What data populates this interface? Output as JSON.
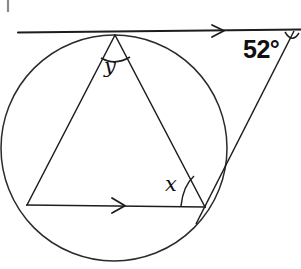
{
  "figure": {
    "type": "circle-geometry-diagram",
    "background_color": "#ffffff",
    "stroke_color": "#1d1d1d"
  },
  "labels": {
    "inscribed_angle_top": "y",
    "inscribed_angle_bottom_right": "x",
    "external_angle": "52°"
  },
  "elements": {
    "circle_name": "circle",
    "tangent_name": "tangent-line",
    "chord_name": "parallel-chord",
    "secant_name": "secant-line",
    "triangle_left_side_name": "triangle-left-side",
    "triangle_right_side_name": "triangle-right-side"
  },
  "geometry": {
    "circle": {
      "cx": 114,
      "cy": 148,
      "r": 113
    },
    "points": {
      "tangent_point_top": {
        "x": 115,
        "y": 35
      },
      "vertex_bottom_left": {
        "x": 27,
        "y": 205
      },
      "vertex_bottom_right": {
        "x": 205,
        "y": 207
      },
      "external_point": {
        "x": 294,
        "y": 30
      }
    },
    "tangent_line": {
      "x1": 18,
      "y1": 32,
      "x2": 301,
      "y2": 29
    },
    "chord_line": {
      "x1": 27,
      "y1": 205,
      "x2": 205,
      "y2": 207
    },
    "arrow_markers": {
      "tangent_arrow_x": 221,
      "chord_arrow_x": 122
    }
  }
}
